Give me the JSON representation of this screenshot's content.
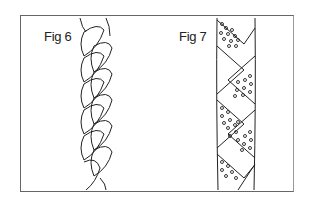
{
  "figures": [
    {
      "id": "fig6",
      "label": "Fig 6",
      "subject": "three-strand braid"
    },
    {
      "id": "fig7",
      "label": "Fig 7",
      "subject": "braid with dotted alternating diamond panels"
    }
  ],
  "colors": {
    "line": "#222222",
    "frame": "#666666",
    "background": "#ffffff"
  }
}
